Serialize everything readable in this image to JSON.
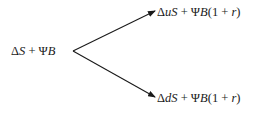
{
  "diagram": {
    "type": "binomial-tree",
    "root": {
      "label_parts": [
        {
          "text": "Δ",
          "italic": false
        },
        {
          "text": "S",
          "italic": true
        },
        {
          "text": " + Ψ",
          "italic": false
        },
        {
          "text": "B",
          "italic": true
        }
      ],
      "label": "ΔS + ΨB"
    },
    "branches": [
      {
        "direction": "up",
        "label": "ΔuS + ΨB(1 + r)",
        "label_parts": [
          {
            "text": "Δ",
            "italic": false
          },
          {
            "text": "uS",
            "italic": true
          },
          {
            "text": " + Ψ",
            "italic": false
          },
          {
            "text": "B",
            "italic": true
          },
          {
            "text": "(1 + ",
            "italic": false
          },
          {
            "text": "r",
            "italic": true
          },
          {
            "text": ")",
            "italic": false
          }
        ]
      },
      {
        "direction": "down",
        "label": "ΔdS + ΨB(1 + r)",
        "label_parts": [
          {
            "text": "Δ",
            "italic": false
          },
          {
            "text": "dS",
            "italic": true
          },
          {
            "text": " + Ψ",
            "italic": false
          },
          {
            "text": "B",
            "italic": true
          },
          {
            "text": "(1 + ",
            "italic": false
          },
          {
            "text": "r",
            "italic": true
          },
          {
            "text": ")",
            "italic": false
          }
        ]
      }
    ],
    "edge_color": "#1a1a1a"
  }
}
